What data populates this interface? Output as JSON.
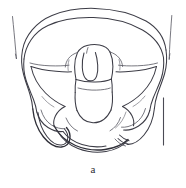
{
  "figure": {
    "caption": "a",
    "style": "black-and-white-line-art",
    "ink_color": "#3c3c46",
    "background_color": "#ffffff",
    "parts": [
      "left-ilium",
      "right-ilium",
      "iliac-crest",
      "sacrum",
      "coccyx",
      "left-pubic-ramus",
      "right-pubic-ramus",
      "pubic-symphysis",
      "left-obturator-foramen",
      "right-obturator-foramen",
      "left-acetabulum",
      "right-acetabulum",
      "left-ischial-spine",
      "right-ischial-spine"
    ],
    "annotations": {
      "left-guide-line": "tapered line at upper left",
      "right-guide-line": "tapered line at upper right",
      "scale-bar": "vertical reference line at right"
    }
  }
}
